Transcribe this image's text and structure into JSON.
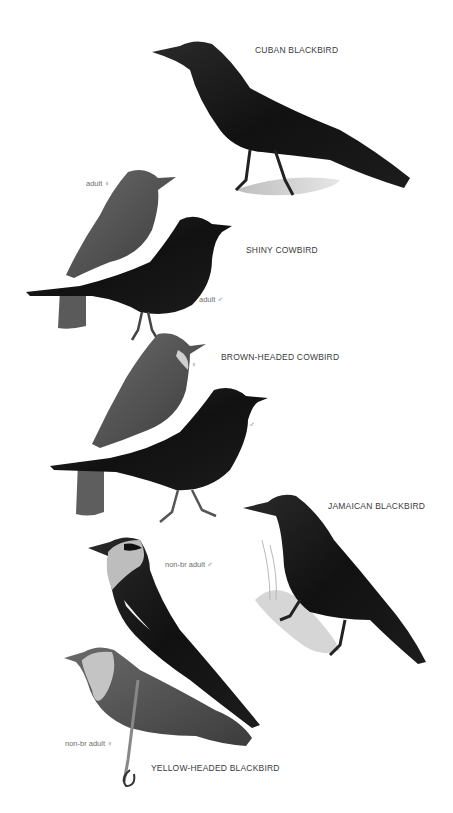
{
  "plate": {
    "background": "#ffffff",
    "species": [
      {
        "name": "CUBAN BLACKBIRD",
        "labels": []
      },
      {
        "name": "SHINY COWBIRD",
        "labels": [
          "adult ♀",
          "adult ♂"
        ]
      },
      {
        "name": "BROWN-HEADED COWBIRD",
        "labels": [
          "♀",
          "♂"
        ]
      },
      {
        "name": "JAMAICAN BLACKBIRD",
        "labels": []
      },
      {
        "name": "YELLOW-HEADED BLACKBIRD",
        "labels": [
          "non-br adult ♂",
          "non-br adult ♀"
        ]
      }
    ]
  }
}
